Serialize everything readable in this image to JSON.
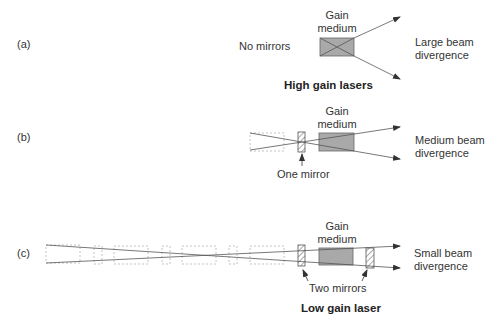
{
  "panels": [
    {
      "id": "a",
      "tag": "(a)",
      "mirror_label": "No mirrors",
      "gain_label_line1": "Gain",
      "gain_label_line2": "medium",
      "divergence_line1": "Large beam",
      "divergence_line2": "divergence",
      "caption": "High gain lasers"
    },
    {
      "id": "b",
      "tag": "(b)",
      "mirror_label": "One mirror",
      "gain_label_line1": "Gain",
      "gain_label_line2": "medium",
      "divergence_line1": "Medium beam",
      "divergence_line2": "divergence"
    },
    {
      "id": "c",
      "tag": "(c)",
      "mirror_label": "Two mirrors",
      "gain_label_line1": "Gain",
      "gain_label_line2": "medium",
      "divergence_line1": "Small beam",
      "divergence_line2": "divergence",
      "caption": "Low gain laser"
    }
  ],
  "colors": {
    "gain_fill": "#a9a9a9",
    "line": "#555555",
    "dashed": "#aaaaaa"
  }
}
